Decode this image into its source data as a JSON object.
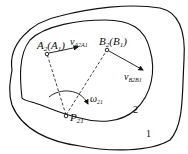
{
  "diagram": {
    "labels": {
      "a_point": "A",
      "a_sub": "2",
      "a_paren": "(A",
      "a_paren_sub": "1",
      "a_close": ")",
      "b_point": "B",
      "b_sub": "2",
      "b_paren": "(B",
      "b_paren_sub": "1",
      "b_close": ")",
      "v_a": "v",
      "v_a_sub": "A2A1",
      "v_b": "v",
      "v_b_sub": "B2B1",
      "omega": "ω",
      "omega_sub": "21",
      "pole": "P",
      "pole_sub": "21",
      "body_2": "2",
      "body_1": "1"
    },
    "colors": {
      "stroke": "#111111",
      "background": "#ffffff"
    }
  }
}
